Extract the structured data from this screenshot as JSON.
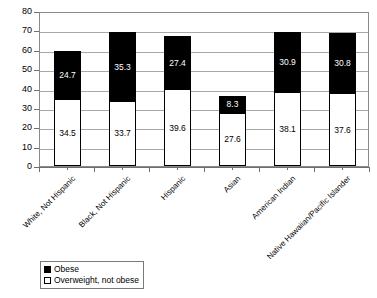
{
  "chart_data": {
    "type": "bar",
    "subtype": "stacked-vertical",
    "title": "",
    "subtitle": "",
    "xlabel": "",
    "ylabel": "",
    "ylim": [
      0,
      80
    ],
    "ytick_step": 10,
    "ytick_labels": [
      "0",
      "10",
      "20",
      "30",
      "40",
      "50",
      "60",
      "70",
      "80"
    ],
    "grid": true,
    "grid_axis": "y",
    "legend_position": "bottom-left",
    "categories": [
      "White, Not Hispanic",
      "Black, Not Hispanic",
      "Hispanic",
      "Asian",
      "American Indian",
      "Native Hawaiian/Pacific Islander"
    ],
    "series": [
      {
        "name": "Overweight, not obese",
        "color": "#ffffff",
        "values": [
          34.5,
          33.7,
          39.6,
          27.6,
          38.1,
          37.6
        ],
        "labels": [
          "34.5",
          "33.7",
          "39.6",
          "27.6",
          "38.1",
          "37.6"
        ]
      },
      {
        "name": "Obese",
        "color": "#000000",
        "values": [
          24.7,
          35.3,
          27.4,
          8.3,
          30.9,
          30.8
        ],
        "labels": [
          "24.7",
          "35.3",
          "27.4",
          "8.3",
          "30.9",
          "30.8"
        ]
      }
    ],
    "totals": [
      59.2,
      69.0,
      67.0,
      35.9,
      69.0,
      68.4
    ]
  },
  "legend": {
    "items": [
      {
        "label": "Obese",
        "swatch": "filled"
      },
      {
        "label": "Overweight, not obese",
        "swatch": "hollow"
      }
    ]
  },
  "colors": {
    "obese": "#000000",
    "overweight": "#ffffff",
    "axis": "#6e6e6e",
    "grid": "#a8a8a8",
    "frame": "#8a8a8a"
  }
}
